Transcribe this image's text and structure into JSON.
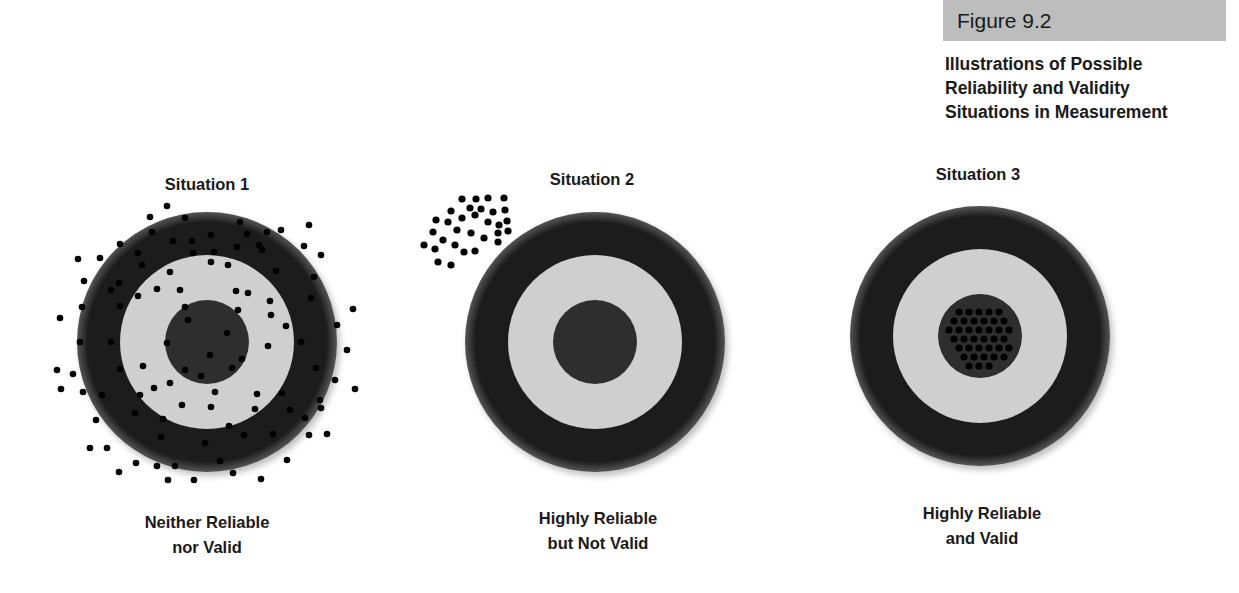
{
  "figure": {
    "label": "Figure 9.2",
    "title": "Illustrations of Possible Reliability and Validity Situations in Measurement",
    "title_lines": [
      "Illustrations of Possible",
      "Reliability and Validity",
      "Situations in Measurement"
    ],
    "label_box_color": "#bdbdbd"
  },
  "colors": {
    "outer_ring": "#1c1c1c",
    "middle_ring": "#cfcfcf",
    "bullseye": "#2e2e2e",
    "shot": "#000000"
  },
  "situations": [
    {
      "heading": "Situation 1",
      "caption_lines": [
        "Neither Reliable",
        "nor Valid"
      ],
      "shot_pattern": "scattered across and around the target",
      "target": {
        "cx": 207,
        "cy": 342,
        "r_outer": 130,
        "r_middle": 87,
        "r_bull": 42
      }
    },
    {
      "heading": "Situation 2",
      "caption_lines": [
        "Highly Reliable",
        "but Not Valid"
      ],
      "shot_pattern": "tight cluster off target (upper-left)",
      "target": {
        "cx": 595,
        "cy": 342,
        "r_outer": 130,
        "r_middle": 87,
        "r_bull": 42
      }
    },
    {
      "heading": "Situation 3",
      "caption_lines": [
        "Highly Reliable",
        "and Valid"
      ],
      "shot_pattern": "tight cluster in the bullseye",
      "target": {
        "cx": 980,
        "cy": 336,
        "r_outer": 130,
        "r_middle": 87,
        "r_bull": 42
      }
    }
  ]
}
